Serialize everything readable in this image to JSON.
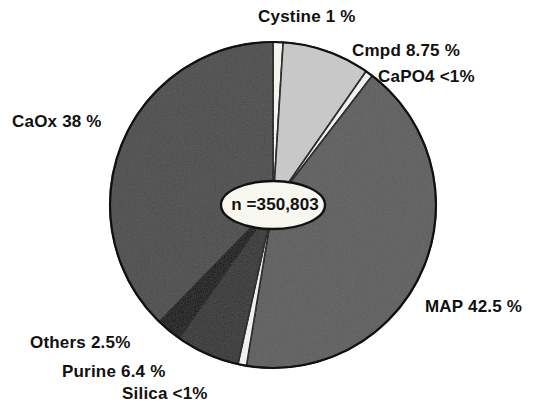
{
  "chart_data": {
    "type": "pie",
    "title": "",
    "subtitle": "",
    "center_annotation": "n =350,803",
    "total_n": 350803,
    "legend_position": "callout-labels",
    "start_angle_deg": -90,
    "direction": "clockwise",
    "categories": [
      "Cystine",
      "Cmpd",
      "CaPO4",
      "MAP",
      "Silica",
      "Purine",
      "Others",
      "CaOx"
    ],
    "values": [
      1,
      8.75,
      0.75,
      42.5,
      0.85,
      6.4,
      2.5,
      38
    ],
    "value_display": [
      "1 %",
      "8.75 %",
      "<1%",
      "42.5 %",
      "<1%",
      "6.4 %",
      "2.5%",
      "38 %"
    ],
    "slices": [
      {
        "name": "Cystine",
        "value": 1,
        "display": "1 %",
        "label": "Cystine 1 %",
        "color": "#f7f7f2",
        "stroke": "#111111"
      },
      {
        "name": "Cmpd",
        "value": 8.75,
        "display": "8.75 %",
        "label": "Cmpd 8.75 %",
        "color": "#c9c9c9",
        "stroke": "#111111"
      },
      {
        "name": "CaPO4",
        "value": 0.75,
        "display": "<1%",
        "label": "CaPO4 <1%",
        "color": "#f2f2ee",
        "stroke": "#111111"
      },
      {
        "name": "MAP",
        "value": 42.5,
        "display": "42.5 %",
        "label": "MAP 42.5 %",
        "color": "#5d5d5d",
        "stroke": "#111111"
      },
      {
        "name": "Silica",
        "value": 0.85,
        "display": "<1%",
        "label": "Silica <1%",
        "color": "#f2f2ee",
        "stroke": "#111111"
      },
      {
        "name": "Purine",
        "value": 6.4,
        "display": "6.4 %",
        "label": "Purine 6.4 %",
        "color": "#333333",
        "stroke": "#111111"
      },
      {
        "name": "Others",
        "value": 2.5,
        "display": "2.5%",
        "label": "Others 2.5%",
        "color": "#0b0b0b",
        "stroke": "#111111"
      },
      {
        "name": "CaOx",
        "value": 38,
        "display": "38 %",
        "label": "CaOx 38 %",
        "color": "#4b4b4b",
        "stroke": "#111111"
      }
    ],
    "geometry": {
      "cx": 273,
      "cy": 205,
      "r": 163
    },
    "xlabel": "",
    "ylabel": "",
    "grid": false
  },
  "labels": {
    "cystine": "Cystine 1 %",
    "cmpd": "Cmpd 8.75 %",
    "capo4": "CaPO4 <1%",
    "caox": "CaOx 38 %",
    "map": "MAP 42.5 %",
    "others": "Others 2.5%",
    "purine": "Purine 6.4 %",
    "silica": "Silica <1%",
    "center": "n =350,803"
  },
  "colors": {
    "background": "#ffffff",
    "outline": "#111111",
    "text": "#111111",
    "caox": "#4b4b4b",
    "map": "#5d5d5d",
    "cmpd": "#c9c9c9",
    "purine": "#333333",
    "others": "#0b0b0b",
    "cystine": "#f7f7f2",
    "capo4": "#f2f2ee",
    "silica": "#f2f2ee"
  }
}
